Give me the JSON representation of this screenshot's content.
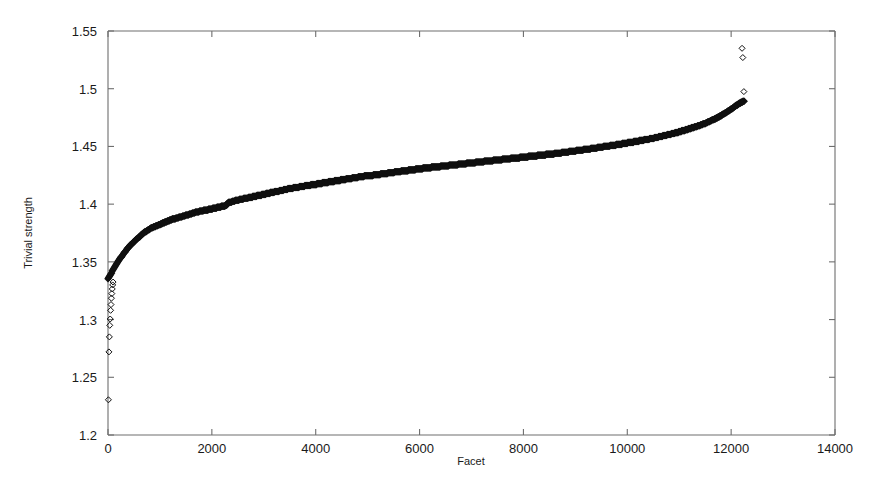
{
  "chart_data": {
    "type": "scatter",
    "title": "",
    "xlabel": "Facet",
    "ylabel": "Trivial strength",
    "xlim": [
      0,
      14000
    ],
    "ylim": [
      1.2,
      1.55
    ],
    "xticks": [
      0,
      2000,
      4000,
      6000,
      8000,
      10000,
      12000,
      14000
    ],
    "xtick_labels": [
      "0",
      "2000",
      "4000",
      "6000",
      "8000",
      "10000",
      "12000",
      "14000"
    ],
    "yticks": [
      1.2,
      1.25,
      1.3,
      1.35,
      1.4,
      1.45,
      1.5,
      1.55
    ],
    "ytick_labels": [
      "1.2",
      "1.25",
      "1.3",
      "1.35",
      "1.4",
      "1.45",
      "1.5",
      "1.55"
    ],
    "grid": false,
    "legend": "none",
    "marker": "open-diamond",
    "marker_color": "#101010",
    "frame_color": "#6e6e6e",
    "background": "#ffffff",
    "n_points": 12260,
    "series": [
      {
        "name": "sorted-trivial-strength",
        "comment": "Sparse low-value outliers at the extreme left of the sorted sequence.",
        "outliers_low": [
          [
            8,
            1.2305
          ],
          [
            18,
            1.272
          ],
          [
            26,
            1.285
          ],
          [
            34,
            1.295
          ],
          [
            42,
            1.3005
          ],
          [
            50,
            1.308
          ],
          [
            58,
            1.313
          ],
          [
            66,
            1.3185
          ],
          [
            74,
            1.3225
          ],
          [
            82,
            1.3265
          ],
          [
            90,
            1.33
          ],
          [
            98,
            1.3325
          ]
        ],
        "outliers_high": [
          [
            12210,
            1.535
          ],
          [
            12225,
            1.527
          ],
          [
            12245,
            1.4975
          ]
        ],
        "x": [
          0,
          60,
          120,
          200,
          300,
          420,
          560,
          700,
          820,
          900,
          980,
          1100,
          1250,
          1400,
          1550,
          1700,
          1850,
          2000,
          2150,
          2290,
          2300,
          2450,
          2600,
          2750,
          2900,
          3000,
          3150,
          3300,
          3500,
          3700,
          3900,
          4100,
          4300,
          4500,
          4700,
          4900,
          5100,
          5300,
          5500,
          5700,
          5900,
          6100,
          6300,
          6500,
          6700,
          6900,
          7100,
          7300,
          7500,
          7700,
          7900,
          8100,
          8300,
          8500,
          8700,
          8900,
          9100,
          9300,
          9500,
          9700,
          9900,
          10100,
          10300,
          10500,
          10700,
          10900,
          11100,
          11300,
          11500,
          11700,
          11850,
          12000,
          12100,
          12180,
          12250
        ],
        "y": [
          1.335,
          1.34,
          1.345,
          1.351,
          1.357,
          1.364,
          1.37,
          1.3755,
          1.379,
          1.3805,
          1.382,
          1.3845,
          1.387,
          1.389,
          1.391,
          1.393,
          1.3945,
          1.396,
          1.3975,
          1.399,
          1.401,
          1.403,
          1.4045,
          1.406,
          1.4075,
          1.4085,
          1.41,
          1.4115,
          1.4135,
          1.415,
          1.4165,
          1.418,
          1.4195,
          1.421,
          1.4225,
          1.424,
          1.425,
          1.4262,
          1.4275,
          1.4288,
          1.43,
          1.4312,
          1.4322,
          1.4332,
          1.4342,
          1.4352,
          1.4362,
          1.4372,
          1.4382,
          1.4392,
          1.4402,
          1.4412,
          1.4422,
          1.4432,
          1.4444,
          1.4456,
          1.4468,
          1.448,
          1.4494,
          1.4508,
          1.4522,
          1.4538,
          1.4554,
          1.4572,
          1.4592,
          1.4614,
          1.464,
          1.4668,
          1.47,
          1.474,
          1.478,
          1.4822,
          1.4855,
          1.4878,
          1.4895
        ]
      }
    ]
  }
}
